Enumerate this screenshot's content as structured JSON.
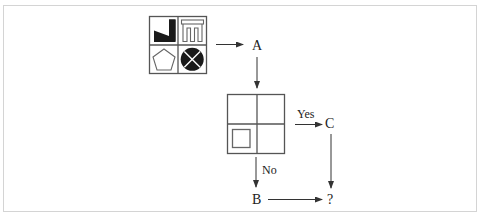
{
  "diagram": {
    "type": "flowchart-puzzle",
    "colors": {
      "stroke": "#555555",
      "fill_dark": "#1a1a1a",
      "frame": "#d4d4d4",
      "background": "#ffffff"
    },
    "source_grid": {
      "cells": [
        {
          "position": "top-left",
          "shape": "black-triangle-wedge"
        },
        {
          "position": "top-right",
          "shape": "gate-outline (three prongs)"
        },
        {
          "position": "bottom-left",
          "shape": "pentagon-outline"
        },
        {
          "position": "bottom-right",
          "shape": "black-circle-with-white-X"
        }
      ]
    },
    "nodes": {
      "a": "A",
      "b": "B",
      "c": "C",
      "result": "?"
    },
    "decision_grid": {
      "cells": [
        {
          "position": "top-left",
          "shape": "empty"
        },
        {
          "position": "top-right",
          "shape": "empty"
        },
        {
          "position": "bottom-left",
          "shape": "small-square-outline"
        },
        {
          "position": "bottom-right",
          "shape": "empty"
        }
      ]
    },
    "edges": {
      "yes_label": "Yes",
      "no_label": "No"
    }
  }
}
